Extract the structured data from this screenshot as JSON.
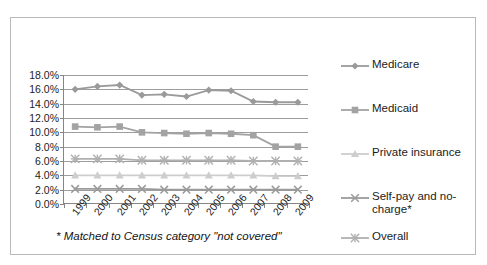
{
  "chart_data": {
    "type": "line",
    "title": "",
    "xlabel": "",
    "ylabel": "",
    "categories": [
      "1999",
      "2000",
      "2001",
      "2002",
      "2003",
      "2004",
      "2005",
      "2006",
      "2007",
      "2008",
      "2009"
    ],
    "ylim": [
      0.0,
      18.0
    ],
    "ytick_labels": [
      "18.0%",
      "16.0%",
      "14.0%",
      "12.0%",
      "10.0%",
      "8.0%",
      "6.0%",
      "4.0%",
      "2.0%",
      "0.0%"
    ],
    "ytick_values": [
      18.0,
      16.0,
      14.0,
      12.0,
      10.0,
      8.0,
      6.0,
      4.0,
      2.0,
      0.0
    ],
    "grid": true,
    "legend_position": "right",
    "series": [
      {
        "name": "Medicare",
        "marker": "diamond",
        "color": "#9a9a9a",
        "values": [
          16.0,
          16.4,
          16.6,
          15.2,
          15.3,
          15.0,
          15.9,
          15.8,
          14.3,
          14.2,
          14.2
        ]
      },
      {
        "name": "Medicaid",
        "marker": "square",
        "color": "#a3a3a3",
        "values": [
          10.8,
          10.7,
          10.8,
          10.0,
          9.9,
          9.8,
          9.9,
          9.8,
          9.6,
          8.0,
          8.0
        ]
      },
      {
        "name": "Private insurance",
        "marker": "triangle",
        "color": "#cdcdcd",
        "values": [
          4.0,
          4.0,
          4.0,
          4.0,
          4.0,
          4.0,
          4.0,
          4.0,
          4.0,
          3.9,
          3.9
        ]
      },
      {
        "name": "Self-pay and no-charge*",
        "marker": "cross",
        "color": "#9a9a9a",
        "values": [
          2.1,
          2.1,
          2.1,
          2.1,
          2.0,
          2.0,
          2.0,
          2.0,
          2.0,
          2.0,
          2.0
        ]
      },
      {
        "name": "Overall",
        "marker": "asterisk",
        "color": "#b0b0b0",
        "values": [
          6.3,
          6.3,
          6.3,
          6.1,
          6.1,
          6.1,
          6.1,
          6.1,
          6.0,
          6.0,
          6.0
        ]
      }
    ],
    "annotations": {
      "footnote": "* Matched to Census category \"not covered\""
    }
  },
  "legend": {
    "items": [
      {
        "label": "Medicare"
      },
      {
        "label": "Medicaid"
      },
      {
        "label": "Private insurance"
      },
      {
        "label": "Self-pay and no-charge*"
      },
      {
        "label": "Overall"
      }
    ]
  },
  "footnote": "* Matched to Census category \"not covered\""
}
